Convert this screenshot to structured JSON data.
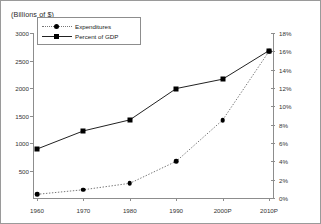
{
  "chart_data": {
    "type": "line",
    "title": "",
    "unit_note": "(Billions of $)",
    "x": [
      "1960",
      "1970",
      "1980",
      "1990",
      "2000P",
      "2010P"
    ],
    "xlabel": "",
    "grid": false,
    "legend_position": "upper-left-inside",
    "axes": {
      "left": {
        "label": "(Billions of $)",
        "ticks": [
          "3000",
          "2500",
          "2000",
          "1500",
          "1000",
          "500"
        ],
        "tick_values": [
          3000,
          2500,
          2000,
          1500,
          1000,
          500
        ],
        "range": [
          0,
          3000
        ]
      },
      "right": {
        "label": "",
        "ticks": [
          "18%",
          "16%",
          "14%",
          "12%",
          "10%",
          "8%",
          "6%",
          "4%",
          "2%",
          "0%"
        ],
        "tick_values": [
          18,
          16,
          14,
          12,
          10,
          8,
          6,
          4,
          2,
          0
        ],
        "range": [
          0,
          18
        ]
      }
    },
    "series": [
      {
        "name": "Expenditures",
        "axis": "right",
        "line_style": "dotted",
        "marker": "round",
        "values": [
          0.4,
          0.9,
          1.6,
          4.0,
          8.5,
          16.0
        ]
      },
      {
        "name": "Percent of GDP",
        "axis": "left",
        "line_style": "solid",
        "marker": "square",
        "values": [
          890,
          1220,
          1420,
          1990,
          2160,
          2680
        ]
      }
    ]
  },
  "legend": {
    "items": [
      {
        "label": "Expenditures"
      },
      {
        "label": "Percent of GDP"
      }
    ]
  },
  "colors": {
    "axis": "#8d8d8d",
    "marker": "#000000",
    "solid_line": "#222222",
    "dotted_line": "#777777",
    "border": "#9a9a9a"
  }
}
